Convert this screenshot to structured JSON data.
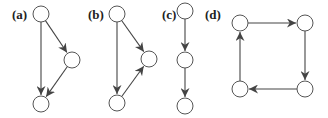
{
  "diagram": {
    "type": "directed-graphs",
    "panels": [
      {
        "label": "(a)",
        "label_pos": [
          12,
          19
        ],
        "nodes": [
          {
            "id": "a1",
            "x": 41,
            "y": 14
          },
          {
            "id": "a2",
            "x": 72,
            "y": 60
          },
          {
            "id": "a3",
            "x": 41,
            "y": 104
          }
        ],
        "edges": [
          {
            "from": "a1",
            "to": "a2"
          },
          {
            "from": "a1",
            "to": "a3"
          },
          {
            "from": "a2",
            "to": "a3"
          }
        ]
      },
      {
        "label": "(b)",
        "label_pos": [
          88,
          19
        ],
        "nodes": [
          {
            "id": "b1",
            "x": 117,
            "y": 14
          },
          {
            "id": "b2",
            "x": 149,
            "y": 59
          },
          {
            "id": "b3",
            "x": 117,
            "y": 103
          }
        ],
        "edges": [
          {
            "from": "b1",
            "to": "b2"
          },
          {
            "from": "b1",
            "to": "b3"
          },
          {
            "from": "b3",
            "to": "b2"
          }
        ]
      },
      {
        "label": "(c)",
        "label_pos": [
          162,
          19
        ],
        "nodes": [
          {
            "id": "c1",
            "x": 185,
            "y": 11
          },
          {
            "id": "c2",
            "x": 185,
            "y": 60
          },
          {
            "id": "c3",
            "x": 185,
            "y": 106
          }
        ],
        "edges": [
          {
            "from": "c1",
            "to": "c2"
          },
          {
            "from": "c2",
            "to": "c3"
          }
        ]
      },
      {
        "label": "(d)",
        "label_pos": [
          205,
          19
        ],
        "nodes": [
          {
            "id": "d1",
            "x": 240,
            "y": 23
          },
          {
            "id": "d2",
            "x": 305,
            "y": 23
          },
          {
            "id": "d3",
            "x": 305,
            "y": 89
          },
          {
            "id": "d4",
            "x": 240,
            "y": 89
          }
        ],
        "edges": [
          {
            "from": "d1",
            "to": "d2"
          },
          {
            "from": "d2",
            "to": "d3"
          },
          {
            "from": "d3",
            "to": "d4"
          },
          {
            "from": "d4",
            "to": "d1"
          }
        ]
      }
    ],
    "node_radius": 8,
    "colors": {
      "stroke": "#555555",
      "edge": "#444444",
      "background": "#ffffff"
    }
  }
}
